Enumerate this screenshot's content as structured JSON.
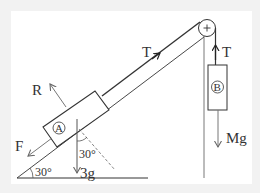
{
  "diagram": {
    "type": "physics-free-body-diagram",
    "labels": {
      "block_a": "A",
      "block_b": "B",
      "tension_string": "T",
      "tension_b": "T",
      "normal_force": "R",
      "friction_force": "F",
      "weight_a": "3g",
      "weight_b": "Mg",
      "incline_angle": "30°",
      "weight_angle": "30°",
      "pulley_symbol": "+"
    },
    "colors": {
      "background": "#f2f2f2",
      "card": "#ffffff",
      "line": "#333333",
      "force_arrow": "#777777"
    }
  }
}
